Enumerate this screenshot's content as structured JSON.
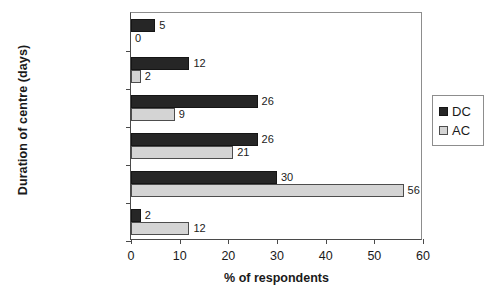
{
  "chart_data": {
    "type": "bar",
    "orientation": "horizontal",
    "title": "",
    "xlabel": "% of respondents",
    "ylabel": "Duration of centre (days)",
    "categories": [
      "Don't know",
      "More than 2",
      "1½–2",
      "1–1½",
      "½–1",
      "Less than ½"
    ],
    "series": [
      {
        "name": "DC",
        "color": "#262626",
        "values": [
          5,
          12,
          26,
          26,
          30,
          2
        ]
      },
      {
        "name": "AC",
        "color": "#d4d4d4",
        "values": [
          0,
          2,
          9,
          21,
          56,
          12
        ]
      }
    ],
    "xlim": [
      0,
      60
    ],
    "xticks": [
      0,
      10,
      20,
      30,
      40,
      50,
      60
    ],
    "xtick_labels": [
      "0",
      "10",
      "20",
      "30",
      "40",
      "50",
      "60"
    ],
    "grid": false,
    "legend_position": "right-outside",
    "legend_entries": [
      "DC",
      "AC"
    ]
  }
}
